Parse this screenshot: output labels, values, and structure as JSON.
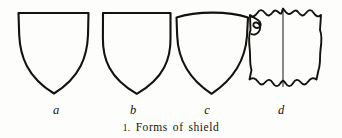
{
  "figure": {
    "caption_number": "1.",
    "caption_text": "Forms of shield",
    "caption_full": "1. Forms of shield",
    "background_color": "#fdfdfb",
    "ink_color": "#14120f",
    "width": 342,
    "height": 138
  },
  "shields": [
    {
      "id": "a",
      "label": "a",
      "label_x": 56,
      "label_y": 105,
      "description": "heater shield with flat top and straight sides tapering to a point",
      "top_style": "flat",
      "edge_style": "plain",
      "has_center_rib": false,
      "has_bouche": false
    },
    {
      "id": "b",
      "label": "b",
      "label_x": 133,
      "label_y": 105,
      "description": "narrow heater shield with flat top and bulging curved sides",
      "top_style": "flat",
      "edge_style": "plain",
      "has_center_rib": false,
      "has_bouche": false
    },
    {
      "id": "c",
      "label": "c",
      "label_x": 207,
      "label_y": 105,
      "description": "shield with arched convex top and curved sides tapering to a point",
      "top_style": "arched",
      "edge_style": "plain",
      "has_center_rib": false,
      "has_bouche": false
    },
    {
      "id": "d",
      "label": "d",
      "label_x": 281,
      "label_y": 105,
      "description": "scalloped targe with wavy edges, central vertical rib and bouche notch at upper left",
      "top_style": "scalloped",
      "edge_style": "wavy",
      "has_center_rib": true,
      "has_bouche": true
    }
  ]
}
